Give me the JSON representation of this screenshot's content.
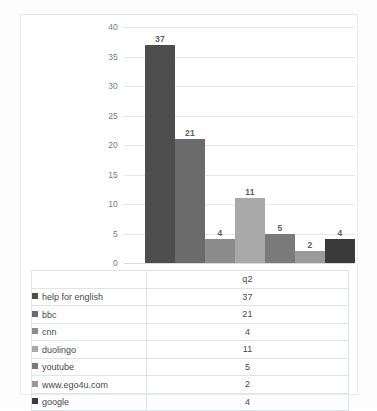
{
  "chart_data": {
    "type": "bar",
    "title": "",
    "xlabel": "",
    "ylabel": "",
    "series_name": "q2",
    "categories": [
      "help for english",
      "bbc",
      "cnn",
      "duolingo",
      "youtube",
      "www.ego4u.com",
      "google"
    ],
    "values": [
      37,
      21,
      4,
      11,
      5,
      2,
      4
    ],
    "value_labels": [
      "37",
      "21",
      "4",
      "11",
      "5",
      "2",
      "4"
    ],
    "ylim": [
      0,
      40
    ],
    "yticks": [
      0,
      5,
      10,
      15,
      20,
      25,
      30,
      35,
      40
    ],
    "ytick_labels": [
      "0",
      "5",
      "10",
      "15",
      "20",
      "25",
      "30",
      "35",
      "40"
    ],
    "grid": true,
    "legend": "table",
    "bar_colors": [
      "#4d4d4d",
      "#6b6b6b",
      "#8c8c8c",
      "#a8a8a8",
      "#7a7a7a",
      "#9a9a9a",
      "#3a3a3a"
    ]
  },
  "table": {
    "value_header": "q2",
    "rows": [
      {
        "label": "help for english",
        "value": "37",
        "color": "#4d4d4d"
      },
      {
        "label": "bbc",
        "value": "21",
        "color": "#6b6b6b"
      },
      {
        "label": "cnn",
        "value": "4",
        "color": "#8c8c8c"
      },
      {
        "label": "duolingo",
        "value": "11",
        "color": "#a8a8a8"
      },
      {
        "label": "youtube",
        "value": "5",
        "color": "#7a7a7a"
      },
      {
        "label": "www.ego4u.com",
        "value": "2",
        "color": "#9a9a9a"
      },
      {
        "label": "google",
        "value": "4",
        "color": "#3a3a3a"
      }
    ]
  }
}
